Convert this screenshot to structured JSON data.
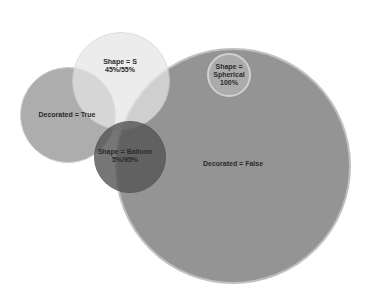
{
  "diagram": {
    "type": "bubble-venn",
    "circles": [
      {
        "id": "decorated-false",
        "label": "Decorated = False",
        "line2": "",
        "line3": "",
        "cx": 233,
        "cy": 166,
        "r": 118,
        "color": "#8f8f8f",
        "opacity": 0.95
      },
      {
        "id": "decorated-true",
        "label": "Decorated = True",
        "line2": "",
        "line3": "",
        "cx": 68,
        "cy": 115,
        "r": 48,
        "color": "#a0a0a0",
        "opacity": 0.85
      },
      {
        "id": "shape-s",
        "label": "Shape = S",
        "line2": "45%/55%",
        "line3": "",
        "cx": 121,
        "cy": 81,
        "r": 49,
        "color": "#e3e3e3",
        "opacity": 0.85
      },
      {
        "id": "shape-balloon",
        "label": "Shape = Balloon",
        "line2": "5%/95%",
        "line3": "",
        "cx": 130,
        "cy": 157,
        "r": 36,
        "color": "#5f5f5f",
        "opacity": 0.85
      },
      {
        "id": "shape-spherical",
        "label": "Shape =",
        "line2": "Spherical",
        "line3": "100%",
        "cx": 229,
        "cy": 75,
        "r": 22,
        "color": "#a9a9a9",
        "opacity": 1.0
      }
    ]
  },
  "labels": {
    "decorated_false": "Decorated = False",
    "decorated_true": "Decorated = True",
    "shape_s_1": "Shape = S",
    "shape_s_2": "45%/55%",
    "shape_balloon_1": "Shape = Balloon",
    "shape_balloon_2": "5%/95%",
    "shape_spherical_1": "Shape =",
    "shape_spherical_2": "Spherical",
    "shape_spherical_3": "100%"
  }
}
